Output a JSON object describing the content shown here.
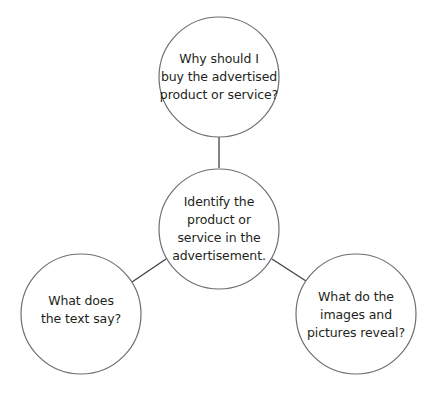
{
  "diagram": {
    "type": "web-organizer",
    "stroke_color": "#6d6e71",
    "connector_color": "#414042",
    "text_color": "#231f20",
    "background": "#ffffff",
    "nodes": {
      "top": {
        "lines": [
          "Why should I",
          "buy the advertised",
          "product or service?"
        ]
      },
      "center": {
        "lines": [
          "Identify the",
          "product or",
          "service in the",
          "advertisement."
        ]
      },
      "left": {
        "lines": [
          "What does",
          "the text say?"
        ]
      },
      "right": {
        "lines": [
          "What do the",
          "images and",
          "pictures reveal?"
        ]
      }
    },
    "edges": [
      {
        "from": "center",
        "to": "top"
      },
      {
        "from": "center",
        "to": "left"
      },
      {
        "from": "center",
        "to": "right"
      }
    ]
  }
}
